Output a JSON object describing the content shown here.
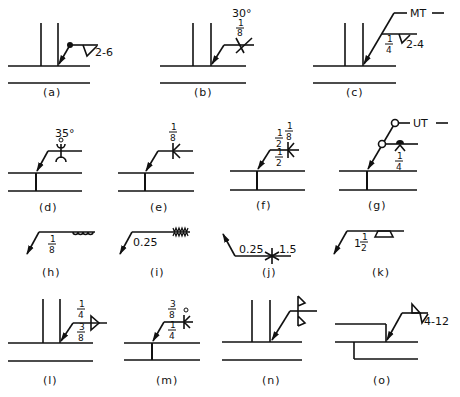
{
  "figure": {
    "panels": [
      {
        "id": "a",
        "caption": "(a)",
        "label": "2-6",
        "symbol": "fillet-weld with weld-all-around dot"
      },
      {
        "id": "b",
        "caption": "(b)",
        "angle": "30°",
        "size": "1/8",
        "symbol": "double bevel / V groove"
      },
      {
        "id": "c",
        "caption": "(c)",
        "test": "MT",
        "size": "1/4",
        "label": "2-4",
        "symbol": "fillet-weld with NDT multiple-arrow reference"
      },
      {
        "id": "d",
        "caption": "(d)",
        "angle": "35°",
        "symbol": "double U groove"
      },
      {
        "id": "e",
        "caption": "(e)",
        "size": "1/8",
        "symbol": "double bevel"
      },
      {
        "id": "f",
        "caption": "(f)",
        "top": "1/8",
        "left_top": "1/2",
        "left_bottom": "1/2",
        "symbol": "double bevel with depths"
      },
      {
        "id": "g",
        "caption": "(g)",
        "test": "UT",
        "size": "1/4",
        "symbol": "melt-thru / back weld with NDT"
      },
      {
        "id": "h",
        "caption": "(h)",
        "size": "1/8",
        "symbol": "surfacing / edge weld"
      },
      {
        "id": "i",
        "caption": "(i)",
        "size": "0.25",
        "symbol": "seam / flash weld"
      },
      {
        "id": "j",
        "caption": "(j)",
        "left": "0.25",
        "right": "1.5",
        "symbol": "stud weld"
      },
      {
        "id": "k",
        "caption": "(k)",
        "size": "1 1/2",
        "symbol": "plug weld"
      },
      {
        "id": "l",
        "caption": "(l)",
        "top": "1/4",
        "bottom": "3/8",
        "symbol": "double fillet"
      },
      {
        "id": "m",
        "caption": "(m)",
        "top": "3/8",
        "bottom": "1/4",
        "symbol": "bevel with field weld flag"
      },
      {
        "id": "n",
        "caption": "(n)",
        "symbol": "double fillet flags"
      },
      {
        "id": "o",
        "caption": "(o)",
        "label": "4-12",
        "symbol": "staggered intermittent fillet on lap joint"
      }
    ]
  },
  "text": {
    "a_label": "2-6",
    "b_angle": "30°",
    "b_num": "1",
    "b_den": "8",
    "c_test": "MT",
    "c_num": "1",
    "c_den": "4",
    "c_label": "2-4",
    "d_angle": "35°",
    "e_num": "1",
    "e_den": "8",
    "f_top_num": "1",
    "f_top_den": "8",
    "f_lt_num": "1",
    "f_lt_den": "2",
    "f_lb_num": "1",
    "f_lb_den": "2",
    "g_test": "UT",
    "g_num": "1",
    "g_den": "4",
    "h_num": "1",
    "h_den": "8",
    "i_size": "0.25",
    "j_left": "0.25",
    "j_right": "1.5",
    "k_whole": "1",
    "k_num": "1",
    "k_den": "2",
    "l_top_num": "1",
    "l_top_den": "4",
    "l_bot_num": "3",
    "l_bot_den": "8",
    "m_top_num": "3",
    "m_top_den": "8",
    "m_bot_num": "1",
    "m_bot_den": "4",
    "o_label": "4-12",
    "captions": {
      "a": "(a)",
      "b": "(b)",
      "c": "(c)",
      "d": "(d)",
      "e": "(e)",
      "f": "(f)",
      "g": "(g)",
      "h": "(h)",
      "i": "(i)",
      "j": "(j)",
      "k": "(k)",
      "l": "(l)",
      "m": "(m)",
      "n": "(n)",
      "o": "(o)"
    }
  }
}
